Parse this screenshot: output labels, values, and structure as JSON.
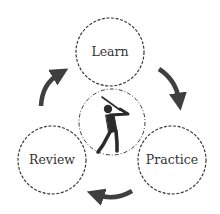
{
  "diagram": {
    "type": "cycle",
    "center": {
      "icon": "golfer-swing-icon"
    },
    "nodes": [
      {
        "id": "learn",
        "label": "Learn"
      },
      {
        "id": "practice",
        "label": "Practice"
      },
      {
        "id": "review",
        "label": "Review"
      }
    ],
    "edges": [
      {
        "from": "Learn",
        "to": "Practice"
      },
      {
        "from": "Practice",
        "to": "Review"
      },
      {
        "from": "Review",
        "to": "Learn"
      }
    ],
    "colors": {
      "stroke": "#3a3a3a",
      "arrow": "#3f3f3f",
      "text": "#333333",
      "background": "#ffffff"
    }
  }
}
